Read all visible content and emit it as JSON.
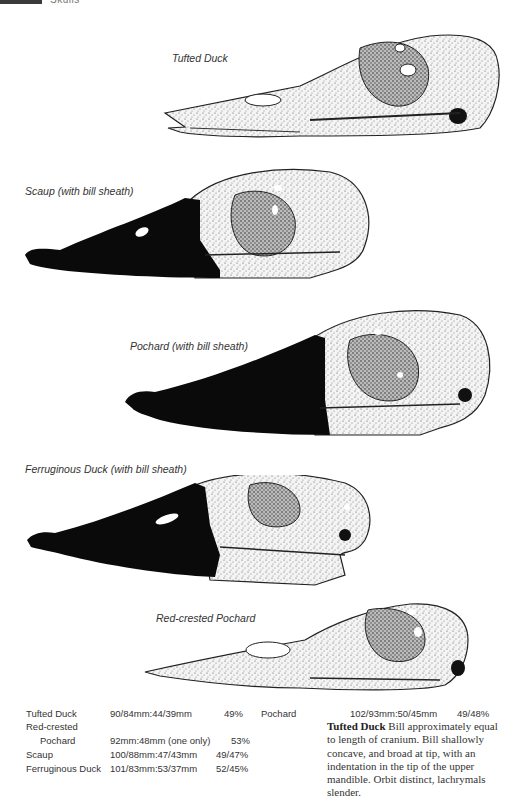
{
  "header": {
    "section": "Skulls"
  },
  "figures": [
    {
      "label": "Tufted Duck"
    },
    {
      "label": "Scaup (with bill sheath)"
    },
    {
      "label": "Pochard (with bill sheath)"
    },
    {
      "label": "Ferruginous Duck (with bill sheath)"
    },
    {
      "label": "Red-crested Pochard"
    }
  ],
  "measurements": {
    "rows": [
      {
        "species": "Tufted Duck",
        "species_cont": "",
        "value": "90/84mm:44/39mm",
        "percent": "49%"
      },
      {
        "species": "Red-crested",
        "species_cont": "Pochard",
        "value": "92mm:48mm (one only)",
        "percent": "53%"
      },
      {
        "species": "Scaup",
        "species_cont": "",
        "value": "100/88mm:47/43mm",
        "percent": "49/47%"
      },
      {
        "species": "Ferruginous Duck",
        "species_cont": "",
        "value": "101/83mm:53/37mm",
        "percent": "52/45%"
      },
      {
        "species": "Pochard",
        "species_cont": "",
        "value": "102/93mm:50/45mm",
        "percent": "49/48%"
      }
    ]
  },
  "description": {
    "title": "Tufted Duck",
    "text": " Bill approximately equal to length of cranium. Bill shallowly concave, and broad at tip, with an indentation in the tip of the upper mandible. Orbit distinct, lachrymals slender."
  }
}
